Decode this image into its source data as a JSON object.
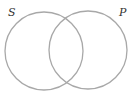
{
  "diagram": {
    "type": "venn",
    "sets": [
      {
        "label": "S",
        "cx": 44,
        "cy": 51,
        "r": 39
      },
      {
        "label": "P",
        "cx": 88,
        "cy": 50,
        "r": 39
      }
    ],
    "stroke_color": "#a8a8a8",
    "label_color": "#333333"
  }
}
